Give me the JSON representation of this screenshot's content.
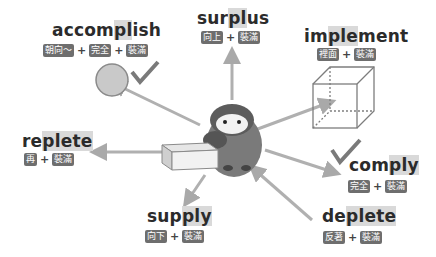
{
  "center": {
    "figure": "penguin holding a box"
  },
  "words": [
    {
      "word": "accomplish",
      "pre": "accom",
      "hl": "pl",
      "post": "ish",
      "parts": [
        "朝向～",
        "完全",
        "裝滿"
      ],
      "icon": "circle-check-icon"
    },
    {
      "word": "surplus",
      "pre": "sur",
      "hl": "pl",
      "post": "us",
      "parts": [
        "向上",
        "裝滿"
      ],
      "icon": "up-arrow-icon"
    },
    {
      "word": "implement",
      "pre": "im",
      "hl": "ple",
      "post": "ment",
      "parts": [
        "裡面",
        "裝滿"
      ],
      "icon": "cube-icon"
    },
    {
      "word": "replete",
      "pre": "re",
      "hl": "plete",
      "post": "",
      "parts": [
        "再",
        "裝滿"
      ],
      "icon": "left-arrow-icon"
    },
    {
      "word": "comply",
      "pre": "com",
      "hl": "ply",
      "post": "",
      "parts": [
        "完全",
        "裝滿"
      ],
      "icon": "check-icon"
    },
    {
      "word": "supply",
      "pre": "sup",
      "hl": "ply",
      "post": "",
      "parts": [
        "向下",
        "裝滿"
      ],
      "icon": "down-arrow-icon"
    },
    {
      "word": "deplete",
      "pre": "de",
      "hl": "plete",
      "post": "",
      "parts": [
        "反著",
        "裝滿"
      ],
      "icon": "inward-arrow-icon"
    }
  ],
  "colors": {
    "text": "#2b2b2b",
    "badge": "#6e6e6e",
    "arrow": "#a9a9a9",
    "highlight": "#d9d9d9"
  }
}
